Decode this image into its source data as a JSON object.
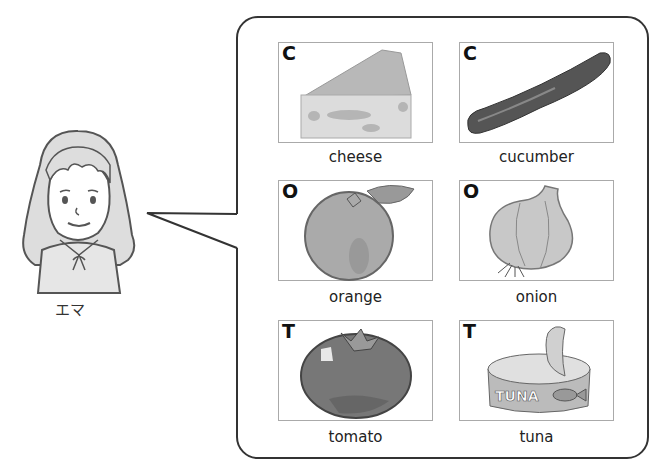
{
  "character": {
    "name": "エマ",
    "icon": "girl-icon"
  },
  "cards": [
    {
      "letter": "C",
      "word": "cheese",
      "icon": "cheese-icon"
    },
    {
      "letter": "C",
      "word": "cucumber",
      "icon": "cucumber-icon"
    },
    {
      "letter": "O",
      "word": "orange",
      "icon": "orange-icon"
    },
    {
      "letter": "O",
      "word": "onion",
      "icon": "onion-icon"
    },
    {
      "letter": "T",
      "word": "tomato",
      "icon": "tomato-icon"
    },
    {
      "letter": "T",
      "word": "tuna",
      "icon": "tuna-can-icon",
      "can_label": "TUNA"
    }
  ]
}
